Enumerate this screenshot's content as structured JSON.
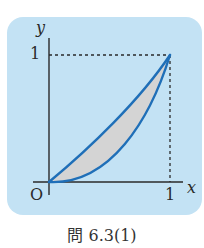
{
  "figure": {
    "caption": "問 6.3(1)",
    "axes": {
      "x_label": "x",
      "y_label": "y",
      "origin_label": "O",
      "x_tick_label": "1",
      "y_tick_label": "1"
    },
    "curves": [
      {
        "name": "upper-curve",
        "description": "slightly curved line from (0,0) to (1,1)"
      },
      {
        "name": "lower-curve",
        "description": "convex curve from (0,0) to (1,1)"
      }
    ],
    "shaded_region": "area between the two curves",
    "colors": {
      "panel_background": "#c3e2f4",
      "curve": "#1f6fb8",
      "shade": "#d4d4d4",
      "axis": "#2a2a2a"
    }
  }
}
